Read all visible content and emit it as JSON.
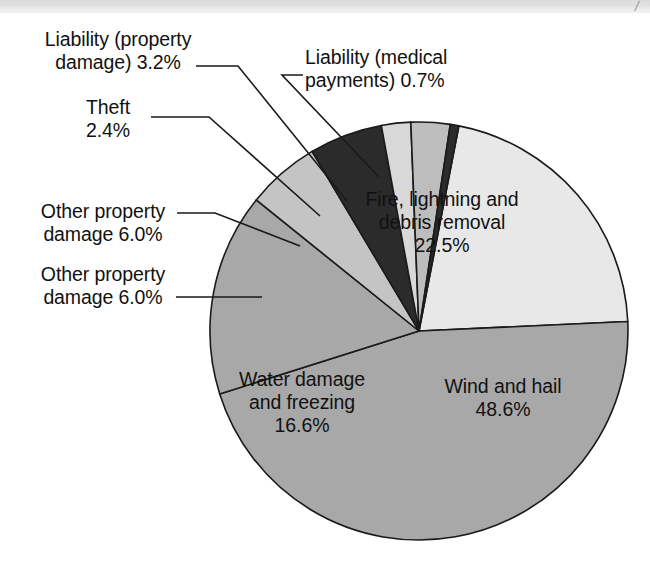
{
  "page": {
    "background": "#ffffff",
    "scan_strip_color": "#dcdcdc",
    "scan_mark_glyph": "/"
  },
  "chart_data": {
    "type": "pie",
    "title": "",
    "subtitle": "",
    "xlabel": "",
    "ylabel": "",
    "legend_position": "none",
    "grid": false,
    "units": "percent",
    "total": 99.99999999999999,
    "categories": [
      "Fire, lightning and debris removal",
      "Wind and hail",
      "Water damage and freezing",
      "Other property damage",
      "Other property damage",
      "Theft",
      "Liability (property damage)",
      "Liability (medical payments)"
    ],
    "values": [
      22.5,
      48.6,
      16.6,
      6.0,
      6.0,
      2.4,
      3.2,
      0.7
    ],
    "slices": [
      {
        "id": "fire",
        "label": "Fire, lightning and\ndebris removal\n22.5%",
        "label_text": "Fire, lightning and debris removal",
        "value": 22.5,
        "value_text": "22.5%",
        "color": "#e8e8e8",
        "label_placement": "inside"
      },
      {
        "id": "wind",
        "label": "Wind and hail\n48.6%",
        "label_text": "Wind and hail",
        "value": 48.6,
        "value_text": "48.6%",
        "color": "#a8a8a8",
        "label_placement": "inside"
      },
      {
        "id": "water",
        "label": "Water damage\nand freezing\n16.6%",
        "label_text": "Water damage and freezing",
        "value": 16.6,
        "value_text": "16.6%",
        "color": "#a8a8a8",
        "label_placement": "inside"
      },
      {
        "id": "other-property-1",
        "label": "Other property\ndamage 6.0%",
        "label_text": "Other property damage",
        "value": 6.0,
        "value_text": "6.0%",
        "color": "#c4c4c4",
        "label_placement": "callout"
      },
      {
        "id": "other-property-2",
        "label": "Other property\ndamage 6.0%",
        "label_text": "Other property damage",
        "value": 6.0,
        "value_text": "6.0%",
        "color": "#2b2b2b",
        "label_placement": "callout"
      },
      {
        "id": "theft",
        "label": "Theft\n2.4%",
        "label_text": "Theft",
        "value": 2.4,
        "value_text": "2.4%",
        "color": "#d8d8d8",
        "label_placement": "callout"
      },
      {
        "id": "liability-property",
        "label": "Liability (property\ndamage) 3.2%",
        "label_text": "Liability (property damage)",
        "value": 3.2,
        "value_text": "3.2%",
        "color": "#bdbdbd",
        "label_placement": "callout"
      },
      {
        "id": "liability-medical",
        "label": "Liability (medical\npayments) 0.7%",
        "label_text": "Liability (medical payments)",
        "value": 0.7,
        "value_text": "0.7%",
        "color": "#2b2b2b",
        "label_placement": "callout"
      }
    ]
  }
}
